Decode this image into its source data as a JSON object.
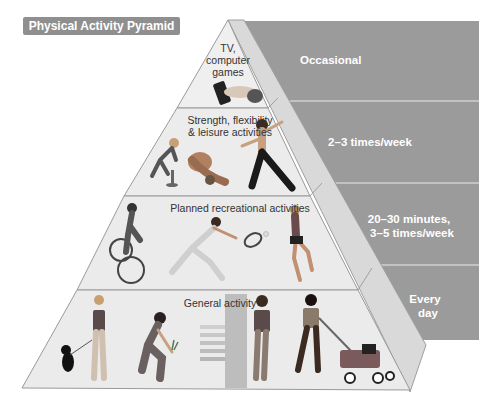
{
  "title": "Physical Activity Pyramid",
  "colors": {
    "panel": "#999999",
    "panel_divider": "#c8c8c8",
    "pyramid_face": "#ebebeb",
    "pyramid_side": "#d6d6d6",
    "edge": "#9a9a9a",
    "title_badge": "#8f8f8f"
  },
  "tiers": [
    {
      "level": 1,
      "activity": "TV, computer games",
      "activity_lines": [
        "TV,",
        "computer",
        "games"
      ],
      "frequency": "Occasional",
      "frequency_lines": [
        "Occasional"
      ],
      "illustrations": [
        "hand-holding-remote-control"
      ]
    },
    {
      "level": 2,
      "activity": "Strength, flexibility & leisure activities",
      "activity_lines": [
        "Strength, flexibility",
        "& leisure activities"
      ],
      "frequency": "2–3 times/week",
      "frequency_lines": [
        "2–3 times/week"
      ],
      "illustrations": [
        "person-doing-step-exercise",
        "person-stretching",
        "person-doing-martial-arts"
      ]
    },
    {
      "level": 3,
      "activity": "Planned recreational activities",
      "activity_lines": [
        "Planned recreational activities"
      ],
      "frequency": "20–30 minutes, 3–5 times/week",
      "frequency_lines": [
        "20–30 minutes,",
        "3–5 times/week"
      ],
      "illustrations": [
        "cyclist",
        "tennis-player",
        "runner"
      ]
    },
    {
      "level": 4,
      "activity": "General activity",
      "activity_lines": [
        "General activity"
      ],
      "frequency": "Every day",
      "frequency_lines": [
        "Every",
        "day"
      ],
      "illustrations": [
        "woman-walking-dog",
        "person-gardening",
        "person-climbing-stairs",
        "man-mowing-lawn"
      ]
    }
  ]
}
